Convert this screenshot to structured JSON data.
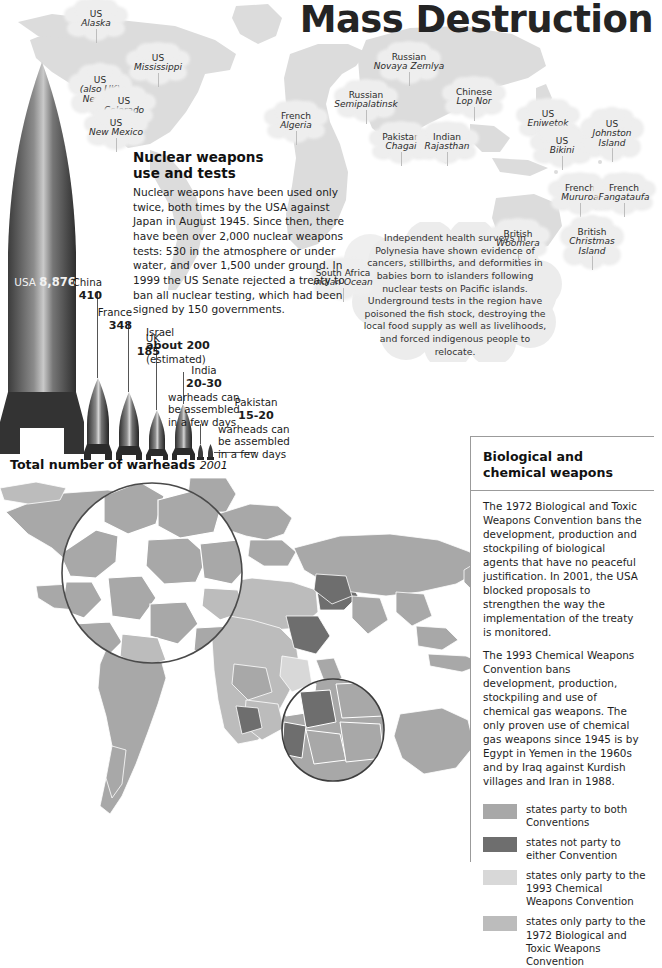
{
  "title": "Mass Destruction",
  "top_map": {
    "sites": [
      {
        "country": "US",
        "place": "Alaska",
        "x": 96,
        "y": 10
      },
      {
        "country": "US",
        "place": "Mississippi",
        "x": 158,
        "y": 54
      },
      {
        "country": "US",
        "place": "(also UK)",
        "place2": "Nevada",
        "x": 100,
        "y": 76
      },
      {
        "country": "US",
        "place": "Colorado",
        "x": 124,
        "y": 97
      },
      {
        "country": "US",
        "place": "New Mexico",
        "x": 116,
        "y": 119
      },
      {
        "country": "French",
        "place": "Algeria",
        "x": 296,
        "y": 112
      },
      {
        "country": "Russian",
        "place": "Novaya Zemlya",
        "x": 409,
        "y": 53
      },
      {
        "country": "Russian",
        "place": "Semipalatinsk",
        "x": 366,
        "y": 91
      },
      {
        "country": "Chinese",
        "place": "Lop Nor",
        "x": 474,
        "y": 88
      },
      {
        "country": "Pakistan",
        "place": "Chagai",
        "x": 401,
        "y": 133
      },
      {
        "country": "Indian",
        "place": "Rajasthan",
        "x": 447,
        "y": 133
      },
      {
        "country": "US",
        "place": "Eniwetok",
        "x": 548,
        "y": 110
      },
      {
        "country": "US",
        "place": "Bikini",
        "x": 562,
        "y": 137
      },
      {
        "country": "US",
        "place": "Johnston",
        "place2": "Island",
        "x": 612,
        "y": 120
      },
      {
        "country": "French",
        "place": "Mururoa",
        "x": 580,
        "y": 184
      },
      {
        "country": "French",
        "place": "Fangataufa",
        "x": 624,
        "y": 184
      },
      {
        "country": "South Africa",
        "place": "Indian Ocean",
        "x": 343,
        "y": 269
      },
      {
        "country": "British",
        "place": "Woomera",
        "x": 518,
        "y": 230
      },
      {
        "country": "British",
        "place": "Christmas",
        "place2": "Island",
        "x": 592,
        "y": 228
      }
    ]
  },
  "nuclear": {
    "heading_line1": "Nuclear weapons",
    "heading_line2": "use and tests",
    "body": "Nuclear weapons have been used only twice, both times by the USA against Japan in August 1945. Since then, there have been over 2,000 nuclear weapons tests: 530 in the atmosphere or under water, and over 1,500 under ground. In 1999 the US Senate rejected a treaty to ban all nuclear testing, which had been signed by 150 governments."
  },
  "polynesia_note": "Independent health surveys in Polynesia have shown evidence of cancers, stillbirths, and deformities in babies born to islanders following nuclear tests on Pacific islands. Underground tests in the region have poisoned the fish stock, destroying the local food supply as well as livelihoods, and forced indigenous people to relocate.",
  "chart_data": {
    "type": "bar",
    "title": "Total number of warheads",
    "title_note": "2001",
    "categories": [
      "USA",
      "China",
      "France",
      "UK",
      "Israel",
      "India",
      "Pakistan"
    ],
    "values": [
      8876,
      410,
      348,
      185,
      200,
      25,
      17
    ],
    "xlabel": "",
    "ylabel": "Number of nuclear warheads",
    "labels": [
      {
        "name": "USA",
        "value": "8,876",
        "note": ""
      },
      {
        "name": "China",
        "value": "410",
        "note": ""
      },
      {
        "name": "France",
        "value": "348",
        "note": ""
      },
      {
        "name": "UK",
        "value": "185",
        "note": ""
      },
      {
        "name": "Israel",
        "value": "about 200",
        "note": "(estimated)"
      },
      {
        "name": "India",
        "value": "20-30",
        "note": "warheads can be assembled in a few days"
      },
      {
        "name": "Pakistan",
        "value": "15-20",
        "note": "warheads can be assembled in a few days"
      }
    ]
  },
  "panel": {
    "heading_line1": "Biological and",
    "heading_line2": "chemical weapons",
    "para1": "The 1972 Biological and Toxic Weapons Convention bans the development, production and stockpiling of biological agents that have no peaceful justification. In 2001, the USA blocked proposals to strengthen the way the implementation of the treaty is monitored.",
    "para2": "The 1993 Chemical Weapons Convention bans development, production, stockpiling and use of chemical gas weapons. The only proven use of chemical gas weapons since 1945 is by Egypt in Yemen in the 1960s and by Iraq against Kurdish villages and Iran in 1988.",
    "legend": [
      {
        "label": "states party to both Conventions",
        "color": "#a8a8a8"
      },
      {
        "label": "states not party to either Convention",
        "color": "#6e6e6e"
      },
      {
        "label": "states only party to the 1993 Chemical Weapons Convention",
        "color": "#d8d8d8"
      },
      {
        "label": "states only party to the 1972 Biological and Toxic Weapons Convention",
        "color": "#bcbcbc"
      }
    ]
  }
}
